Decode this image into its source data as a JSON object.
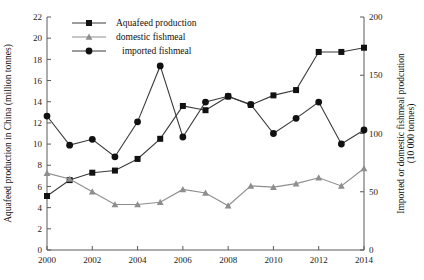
{
  "chart_data": {
    "type": "line",
    "title": "",
    "xlabel": "",
    "ylabel": "Aquafeed production in China (million tonnes)",
    "y2label": "Imported or domestic fishmeal prodcution",
    "y2label_line2": "(10 000 tonnes)",
    "x": [
      2000,
      2001,
      2002,
      2003,
      2004,
      2005,
      2006,
      2007,
      2008,
      2009,
      2010,
      2011,
      2012,
      2013,
      2014
    ],
    "xlim": [
      2000,
      2014
    ],
    "xticks": [
      2000,
      2002,
      2004,
      2006,
      2008,
      2010,
      2012,
      2014
    ],
    "ylim": [
      0,
      22
    ],
    "yticks": [
      0,
      2,
      4,
      6,
      8,
      10,
      12,
      14,
      16,
      18,
      20,
      22
    ],
    "y2lim": [
      0,
      200
    ],
    "y2ticks": [
      0,
      50,
      100,
      150,
      200
    ],
    "grid": false,
    "legend_position": "top-left",
    "series": [
      {
        "name": "Aquafeed production",
        "axis": "left",
        "marker": "square",
        "color": "#111111",
        "values": [
          5.1,
          6.6,
          7.3,
          7.5,
          8.6,
          10.5,
          13.6,
          13.2,
          14.5,
          13.7,
          14.6,
          15.1,
          18.7,
          18.7,
          19.1
        ]
      },
      {
        "name": "domestic fishmeal",
        "axis": "right",
        "marker": "triangle",
        "color": "#8e8e8e",
        "values": [
          66,
          61,
          50,
          39,
          39,
          41,
          52,
          49,
          38,
          55,
          54,
          57,
          62,
          55,
          70
        ]
      },
      {
        "name": "imported fishmeal",
        "axis": "right",
        "marker": "circle",
        "color": "#111111",
        "values": [
          115,
          90,
          95,
          80,
          110,
          158,
          97,
          127,
          132,
          125,
          100,
          113,
          127,
          91,
          103
        ]
      }
    ]
  }
}
